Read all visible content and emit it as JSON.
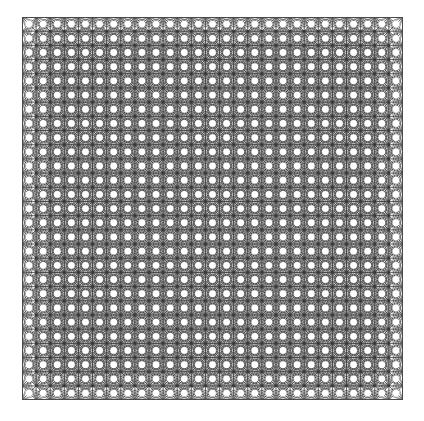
{
  "figure": {
    "title": "",
    "background_color": "#ffffff",
    "canvas_width": 424,
    "canvas_height": 421
  },
  "chart_data": {
    "type": "scatter",
    "title": "",
    "subtitle": "",
    "xlabel": "",
    "ylabel": "",
    "render_mode": "line-graph-lattice",
    "grid": true,
    "legend": null,
    "annotations": [],
    "plot_area": {
      "x": 22,
      "y": 17,
      "width": 381,
      "height": 383
    },
    "lattice": {
      "node_columns": 28,
      "node_rows": 28,
      "cell_period_x": 14.11,
      "cell_period_y": 14.19,
      "node_count": 784,
      "void_shape": "circle",
      "void_radius": 3.4
    },
    "edges": {
      "line_color": "#3a3a3a",
      "line_width": 0.55,
      "line_opacity": 0.95,
      "neighbor_offsets": [
        [
          1,
          0
        ],
        [
          0,
          1
        ],
        [
          1,
          1
        ],
        [
          1,
          -1
        ],
        [
          2,
          1
        ],
        [
          1,
          2
        ],
        [
          2,
          -1
        ],
        [
          1,
          -2
        ],
        [
          2,
          0
        ],
        [
          0,
          2
        ],
        [
          2,
          2
        ],
        [
          2,
          -2
        ],
        [
          3,
          1
        ],
        [
          1,
          3
        ],
        [
          3,
          -1
        ],
        [
          1,
          -3
        ]
      ]
    },
    "border": {
      "show": true,
      "color": "#4a4a4a",
      "width": 1
    },
    "xlim": [
      0,
      27
    ],
    "ylim": [
      0,
      27
    ],
    "x": [],
    "values": []
  }
}
